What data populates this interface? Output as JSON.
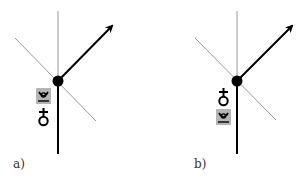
{
  "panels": [
    {
      "id": "a",
      "label": "a)",
      "node": {
        "x": 58,
        "y": 81
      },
      "symbols_order": [
        "boxed-horn",
        "cross-circle"
      ]
    },
    {
      "id": "b",
      "label": "b)",
      "node": {
        "x": 237,
        "y": 81
      },
      "symbols_order": [
        "cross-circle",
        "boxed-horn"
      ]
    }
  ],
  "glyphs": {
    "cross_circle": "♁",
    "horn": "𝌂"
  },
  "colors": {
    "thin_line": "#999999",
    "thick_line": "#000000",
    "box_fill": "#b5b5b5"
  }
}
